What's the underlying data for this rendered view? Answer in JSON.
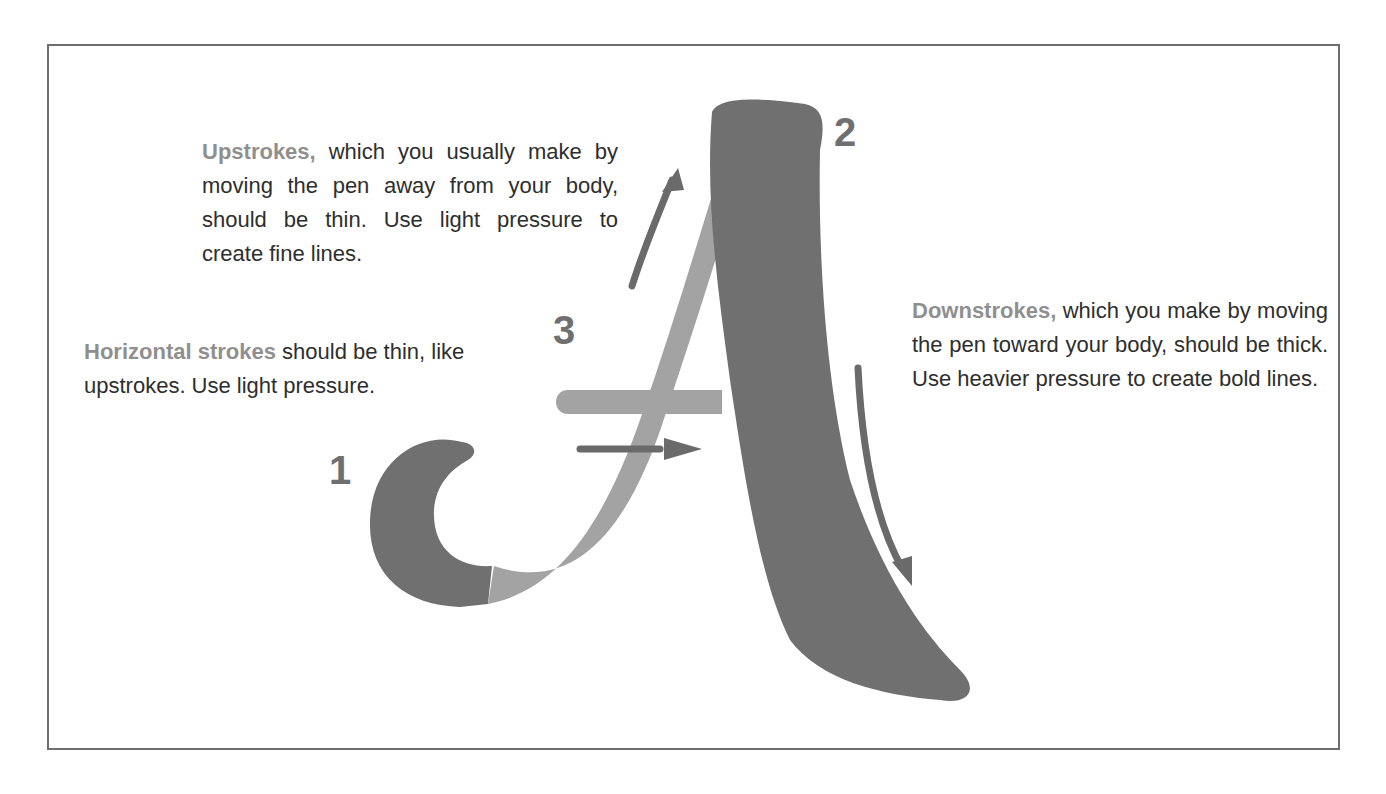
{
  "diagram": {
    "colors": {
      "thick_stroke": "#707070",
      "thin_stroke": "#a3a3a3",
      "arrow": "#6a6a6a",
      "heading_highlight": "#8f8f8f",
      "body_text": "#2e2e2e",
      "frame_border": "#6e6e6e"
    },
    "stroke_numbers": [
      "1",
      "2",
      "3"
    ],
    "annotations": {
      "upstrokes": {
        "heading": "Upstrokes,",
        "body": " which you usually make by moving the pen away from your body, should be thin. Use light pressure to create fine lines."
      },
      "horizontal": {
        "heading": "Horizontal strokes",
        "body": " should be thin, like upstrokes. Use light pressure."
      },
      "downstrokes": {
        "heading": "Downstrokes,",
        "body": " which you make by moving the pen toward your body, should be thick. Use heavier pressure to create bold lines."
      }
    }
  }
}
